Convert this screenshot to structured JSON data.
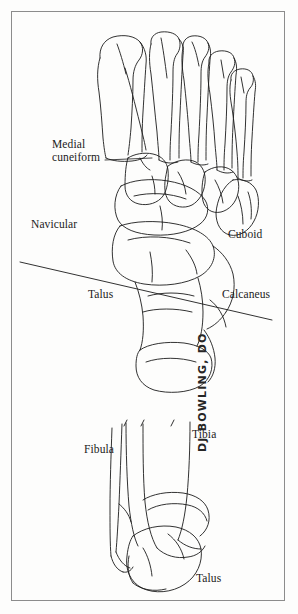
{
  "figure": {
    "style": {
      "ink_color": "#1b1b1b",
      "border_color": "#8c8c8c",
      "background_color": "#fdfdfc"
    },
    "signature": "DJ BOWLING, DO"
  },
  "upper_view": {
    "name": "dorsal-foot-view",
    "labels": [
      {
        "id": "medial-cuneiform",
        "text": "Medial\ncuneiform",
        "x": 52,
        "y": 138,
        "leader": true
      },
      {
        "id": "navicular",
        "text": "Navicular",
        "x": 31,
        "y": 218,
        "leader": false
      },
      {
        "id": "cuboid",
        "text": "Cuboid",
        "x": 228,
        "y": 228,
        "leader": false
      },
      {
        "id": "talus",
        "text": "Talus",
        "x": 88,
        "y": 288,
        "leader": false
      },
      {
        "id": "calcaneus",
        "text": "Calcaneus",
        "x": 222,
        "y": 288,
        "leader": false
      }
    ],
    "reference_line": {
      "id": "axis-reference-line",
      "x1": 20,
      "y1": 262,
      "x2": 272,
      "y2": 320
    }
  },
  "lower_view": {
    "name": "anterior-ankle-view",
    "labels": [
      {
        "id": "fibula",
        "text": "Fibula",
        "x": 84,
        "y": 443,
        "leader": false
      },
      {
        "id": "tibia",
        "text": "Tibia",
        "x": 192,
        "y": 428,
        "leader": false
      },
      {
        "id": "talus-ankle",
        "text": "Talus",
        "x": 196,
        "y": 572,
        "leader": false
      }
    ]
  }
}
